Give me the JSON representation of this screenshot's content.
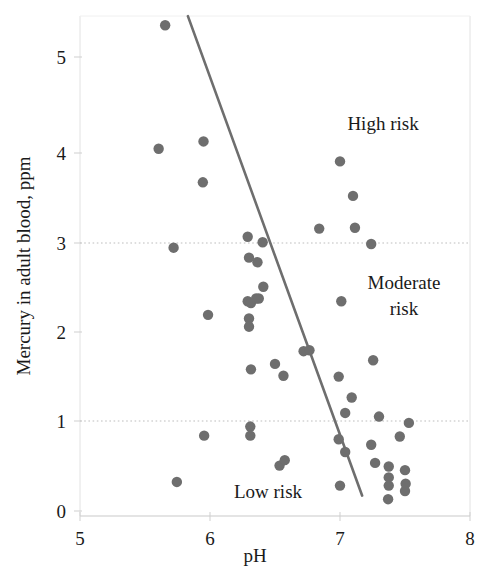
{
  "chart_data": {
    "type": "scatter",
    "title": "",
    "xlabel": "pH",
    "ylabel": "Mercury in adult blood, ppm",
    "xlim": [
      5,
      8
    ],
    "ylim": [
      0,
      5.6
    ],
    "xticks": [
      5,
      6,
      7,
      8
    ],
    "xtick_labels": [
      "5",
      "6",
      "7",
      "8"
    ],
    "yticks": [
      0,
      1,
      2,
      3,
      4,
      5
    ],
    "ytick_labels": [
      "0",
      "1",
      "2",
      "3",
      "4",
      "5"
    ],
    "grid": "horizontal dotted reference lines at y = 1 and y = 3",
    "gridlines_y": [
      1,
      3
    ],
    "legend": "none",
    "point_color": "#6e6e6e",
    "line_color": "#6e6e6e",
    "annotations": [
      {
        "text": "High risk",
        "x": 7.33,
        "y": 4.35
      },
      {
        "text": "Moderate",
        "x": 7.45,
        "y": 2.62
      },
      {
        "text": "risk",
        "x": 7.45,
        "y": 2.33
      },
      {
        "text": "Low risk",
        "x": 6.57,
        "y": 0.23
      }
    ],
    "trendline": {
      "x1": 5.83,
      "y1": 5.45,
      "x2": 7.17,
      "y2": 0.17
    },
    "points": [
      {
        "x": 5.655,
        "y": 5.35
      },
      {
        "x": 5.605,
        "y": 3.99
      },
      {
        "x": 5.95,
        "y": 4.07
      },
      {
        "x": 5.945,
        "y": 3.62
      },
      {
        "x": 5.72,
        "y": 2.9
      },
      {
        "x": 5.985,
        "y": 2.16
      },
      {
        "x": 5.955,
        "y": 0.83
      },
      {
        "x": 5.745,
        "y": 0.32
      },
      {
        "x": 6.29,
        "y": 3.02
      },
      {
        "x": 6.3,
        "y": 2.79
      },
      {
        "x": 6.365,
        "y": 2.74
      },
      {
        "x": 6.29,
        "y": 2.31
      },
      {
        "x": 6.315,
        "y": 2.29
      },
      {
        "x": 6.355,
        "y": 2.34
      },
      {
        "x": 6.375,
        "y": 2.34
      },
      {
        "x": 6.3,
        "y": 2.12
      },
      {
        "x": 6.3,
        "y": 2.03
      },
      {
        "x": 6.315,
        "y": 1.56
      },
      {
        "x": 6.31,
        "y": 0.93
      },
      {
        "x": 6.31,
        "y": 0.83
      },
      {
        "x": 6.405,
        "y": 2.96
      },
      {
        "x": 6.41,
        "y": 2.47
      },
      {
        "x": 6.5,
        "y": 1.62
      },
      {
        "x": 6.565,
        "y": 1.49
      },
      {
        "x": 6.535,
        "y": 0.5
      },
      {
        "x": 6.575,
        "y": 0.56
      },
      {
        "x": 6.72,
        "y": 1.76
      },
      {
        "x": 6.765,
        "y": 1.77
      },
      {
        "x": 6.84,
        "y": 3.11
      },
      {
        "x": 7.0,
        "y": 3.85
      },
      {
        "x": 7.1,
        "y": 3.47
      },
      {
        "x": 7.115,
        "y": 3.12
      },
      {
        "x": 7.24,
        "y": 2.94
      },
      {
        "x": 7.01,
        "y": 2.31
      },
      {
        "x": 6.99,
        "y": 1.48
      },
      {
        "x": 7.09,
        "y": 1.25
      },
      {
        "x": 7.04,
        "y": 1.08
      },
      {
        "x": 7.255,
        "y": 1.66
      },
      {
        "x": 7.3,
        "y": 1.04
      },
      {
        "x": 7.53,
        "y": 0.97
      },
      {
        "x": 7.46,
        "y": 0.82
      },
      {
        "x": 6.99,
        "y": 0.79
      },
      {
        "x": 7.04,
        "y": 0.65
      },
      {
        "x": 7.24,
        "y": 0.73
      },
      {
        "x": 7.27,
        "y": 0.53
      },
      {
        "x": 7.375,
        "y": 0.49
      },
      {
        "x": 7.375,
        "y": 0.37
      },
      {
        "x": 7.375,
        "y": 0.28
      },
      {
        "x": 7.37,
        "y": 0.13
      },
      {
        "x": 7.5,
        "y": 0.45
      },
      {
        "x": 7.505,
        "y": 0.3
      },
      {
        "x": 7.5,
        "y": 0.22
      },
      {
        "x": 7.0,
        "y": 0.28
      }
    ]
  },
  "axis": {
    "x_title": "pH",
    "y_title": "Mercury in adult blood, ppm"
  }
}
